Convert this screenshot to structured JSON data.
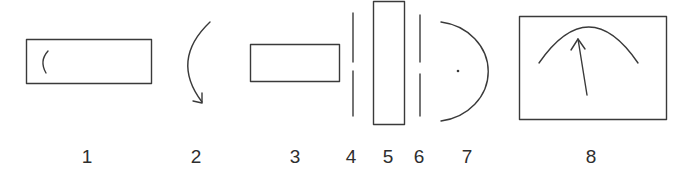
{
  "diagram": {
    "type": "optical-apparatus-schematic",
    "stroke_color": "#3a3a3a",
    "background": "#ffffff",
    "components": [
      {
        "id": 1,
        "label": "1",
        "shape": "rectangle with small arc (light source)"
      },
      {
        "id": 2,
        "label": "2",
        "shape": "curved arrow"
      },
      {
        "id": 3,
        "label": "3",
        "shape": "rectangle"
      },
      {
        "id": 4,
        "label": "4",
        "shape": "slit (split vertical line)"
      },
      {
        "id": 5,
        "label": "5",
        "shape": "tall rectangle"
      },
      {
        "id": 6,
        "label": "6",
        "shape": "slit (split vertical line)"
      },
      {
        "id": 7,
        "label": "7",
        "shape": "semicircle with center dot"
      },
      {
        "id": 8,
        "label": "8",
        "shape": "meter (rectangle with arc scale and needle)"
      }
    ]
  },
  "labels": [
    "1",
    "2",
    "3",
    "4",
    "5",
    "6",
    "7",
    "8"
  ]
}
